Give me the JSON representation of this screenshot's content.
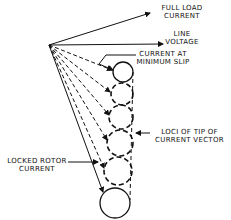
{
  "diagram": {
    "type": "vector-locus",
    "colors": {
      "ink": "#111111",
      "background": "#ffffff"
    },
    "labels": {
      "full_load_current": [
        "FULL LOAD",
        "CURRENT"
      ],
      "line_voltage": [
        "LINE",
        "VOLTAGE"
      ],
      "current_min_slip": [
        "CURRENT AT",
        "MINIMUM SLIP"
      ],
      "loci": [
        "LOCI OF TIP OF",
        "CURRENT VECTOR"
      ],
      "locked_rotor": [
        "LOCKED ROTOR",
        "CURRENT"
      ]
    },
    "origin": [
      49,
      45
    ],
    "vectors": [
      {
        "name": "full-load-current",
        "to": [
          150,
          13
        ],
        "style": "solid"
      },
      {
        "name": "line-voltage",
        "to": [
          163,
          44
        ],
        "style": "solid"
      }
    ],
    "circles": [
      {
        "cx": 123,
        "cy": 72,
        "r": 10,
        "style": "solid"
      },
      {
        "cx": 122,
        "cy": 94,
        "r": 11,
        "style": "dashed"
      },
      {
        "cx": 121,
        "cy": 117,
        "r": 12,
        "style": "dashed"
      },
      {
        "cx": 120,
        "cy": 143,
        "r": 13,
        "style": "dashed"
      },
      {
        "cx": 118,
        "cy": 171,
        "r": 14,
        "style": "dashed"
      },
      {
        "cx": 115,
        "cy": 203,
        "r": 15,
        "style": "solid"
      }
    ]
  }
}
